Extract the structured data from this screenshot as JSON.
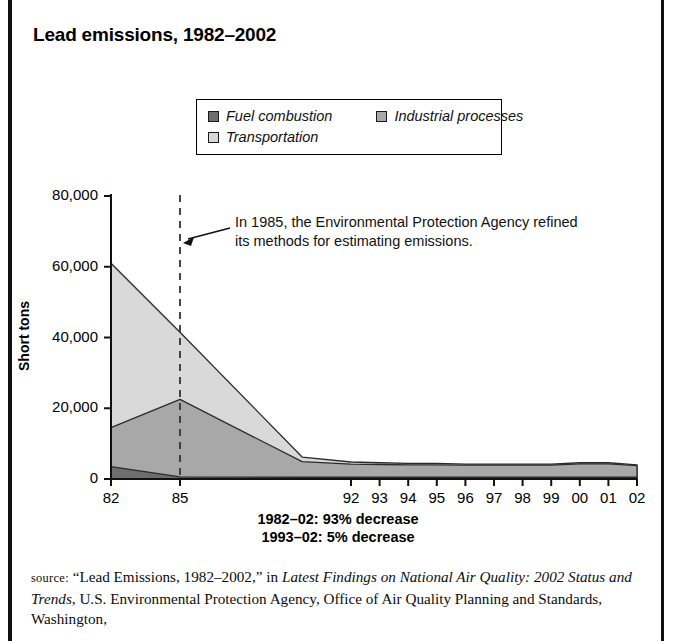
{
  "title": "Lead emissions, 1982–2002",
  "legend": {
    "items": [
      {
        "label": "Fuel combustion",
        "color": "#6e6e6e",
        "name": "fuel-combustion"
      },
      {
        "label": "Industrial processes",
        "color": "#a8a8a8",
        "name": "industrial-processes"
      },
      {
        "label": "Transportation",
        "color": "#d9d9d9",
        "name": "transportation"
      }
    ]
  },
  "axes": {
    "ylabel": "Short tons",
    "yticks": [
      "0",
      "20,000",
      "40,000",
      "60,000",
      "80,000"
    ],
    "ytick_values": [
      0,
      20000,
      40000,
      60000,
      80000
    ],
    "ylim": [
      0,
      80000
    ],
    "xticks": [
      "82",
      "85",
      "92",
      "93",
      "94",
      "95",
      "96",
      "97",
      "98",
      "99",
      "00",
      "01",
      "02"
    ]
  },
  "annotation": {
    "line1": "In 1985, the Environmental Protection Agency refined",
    "line2": "its methods for estimating emissions.",
    "marker_year": 1985
  },
  "footnotes": {
    "line1": "1982–02: 93% decrease",
    "line2": "1993–02: 5% decrease"
  },
  "source": {
    "label": "source:",
    "quoted_title": "“Lead Emissions, 1982–2002,”",
    "connector": " in ",
    "italic_title": "Latest Findings on National Air Quality: 2002 Status and Trends",
    "rest": ", U.S. Environmental Protection Agency, Office of Air Quality Planning and Standards, Washington,"
  },
  "chart_data": {
    "type": "area",
    "title": "Lead emissions, 1982–2002",
    "xlabel": "",
    "ylabel": "Short tons",
    "ylim": [
      0,
      80000
    ],
    "grid": false,
    "stacked": true,
    "legend_position": "top",
    "x": [
      1982,
      1985,
      1990,
      1992,
      1993,
      1994,
      1995,
      1996,
      1997,
      1998,
      1999,
      2000,
      2001,
      2002
    ],
    "xtick_labels": [
      "82",
      "85",
      "92",
      "93",
      "94",
      "95",
      "96",
      "97",
      "98",
      "99",
      "00",
      "01",
      "02"
    ],
    "xtick_years": [
      1982,
      1985,
      1992,
      1993,
      1994,
      1995,
      1996,
      1997,
      1998,
      1999,
      2000,
      2001,
      2002
    ],
    "series": [
      {
        "name": "Fuel combustion",
        "color": "#6e6e6e",
        "values": [
          3500,
          600,
          500,
          500,
          500,
          500,
          500,
          500,
          500,
          500,
          500,
          500,
          500,
          500
        ]
      },
      {
        "name": "Industrial processes",
        "color": "#a8a8a8",
        "values": [
          11000,
          21900,
          4400,
          3700,
          3600,
          3500,
          3500,
          3400,
          3400,
          3400,
          3400,
          3800,
          3800,
          3300
        ]
      },
      {
        "name": "Transportation",
        "color": "#d9d9d9",
        "values": [
          46500,
          19000,
          1300,
          600,
          500,
          400,
          400,
          300,
          300,
          300,
          300,
          300,
          300,
          200
        ]
      }
    ],
    "stack_tops": {
      "fuel_combustion": [
        3500,
        600,
        500,
        500,
        500,
        500,
        500,
        500,
        500,
        500,
        500,
        500,
        500,
        500
      ],
      "plus_industrial": [
        14500,
        22500,
        4900,
        4200,
        4100,
        4000,
        4000,
        3900,
        3900,
        3900,
        3900,
        4300,
        4300,
        3800
      ],
      "total": [
        61000,
        41500,
        6200,
        4800,
        4600,
        4400,
        4400,
        4200,
        4200,
        4200,
        4200,
        4600,
        4600,
        4000
      ]
    },
    "annotations": [
      {
        "text": "In 1985, the Environmental Protection Agency refined its methods for estimating emissions.",
        "at_year": 1985
      }
    ],
    "notes": [
      "1982–02: 93% decrease",
      "1993–02: 5% decrease"
    ]
  }
}
